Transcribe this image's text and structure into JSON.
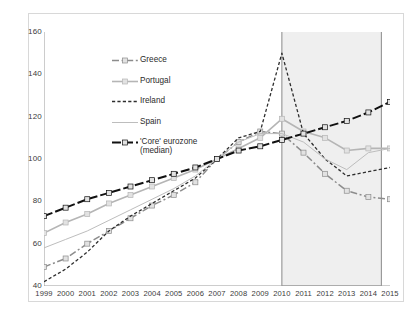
{
  "chart_data": {
    "type": "line",
    "title": "",
    "xlabel": "",
    "ylabel": "",
    "xlim": [
      1999,
      2015
    ],
    "ylim": [
      40,
      160
    ],
    "grid": false,
    "legend_position": "upper-center",
    "x": [
      1999,
      2000,
      2001,
      2002,
      2003,
      2004,
      2005,
      2006,
      2007,
      2008,
      2009,
      2010,
      2011,
      2012,
      2013,
      2014,
      2015
    ],
    "yticks": [
      40,
      60,
      80,
      100,
      120,
      140,
      160
    ],
    "xticks": [
      "1999",
      "2000",
      "2001",
      "2002",
      "2003",
      "2004",
      "2005",
      "2006",
      "2007",
      "2008",
      "2009",
      "2010",
      "2011",
      "2012",
      "2013",
      "2014",
      "2015"
    ],
    "shaded_region": {
      "from": 2010,
      "to": 2014.6,
      "color": "#efefef",
      "border": "#8a8a8a"
    },
    "series": [
      {
        "name": "Greece",
        "color": "#8c8c8c",
        "style": "dash-dot",
        "width": 1.5,
        "marker": "square",
        "values": [
          49,
          53,
          60,
          66,
          72,
          78,
          83,
          89,
          100,
          108,
          113,
          112,
          103,
          93,
          85,
          82,
          81
        ]
      },
      {
        "name": "Portugal",
        "color": "#b5b5b5",
        "style": "solid",
        "width": 1.6,
        "marker": "square",
        "values": [
          65,
          70,
          74,
          79,
          83,
          87,
          91,
          95,
          100,
          105,
          110,
          119,
          113,
          110,
          104,
          105,
          105
        ]
      },
      {
        "name": "Ireland",
        "color": "#2e2e2e",
        "style": "dashed",
        "width": 1.3,
        "marker": "none",
        "values": [
          42,
          48,
          56,
          66,
          73,
          79,
          85,
          91,
          100,
          110,
          113,
          150,
          112,
          100,
          92,
          94,
          96
        ]
      },
      {
        "name": "Spain",
        "color": "#bdbdbd",
        "style": "solid",
        "width": 1.0,
        "marker": "none",
        "values": [
          58,
          62,
          66,
          71,
          76,
          81,
          86,
          92,
          100,
          108,
          112,
          112,
          108,
          100,
          95,
          103,
          105
        ]
      },
      {
        "name": "'Core' eurozone\n(median)",
        "color": "#111111",
        "style": "dash-long",
        "width": 2.0,
        "marker": "square",
        "values": [
          73,
          77,
          81,
          84,
          87,
          90,
          93,
          96,
          100,
          104,
          106,
          109,
          112,
          115,
          118,
          122,
          127
        ]
      }
    ]
  },
  "legend": {
    "items": [
      {
        "label": "Greece"
      },
      {
        "label": "Portugal"
      },
      {
        "label": "Ireland"
      },
      {
        "label": "Spain"
      },
      {
        "label": "'Core' eurozone\n(median)"
      }
    ]
  }
}
